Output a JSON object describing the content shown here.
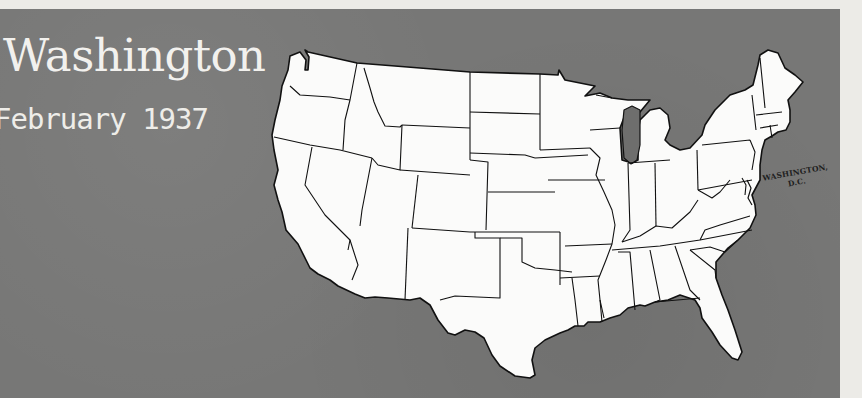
{
  "title": "Washington",
  "subtitle": "February 1937",
  "map": {
    "region": "Contiguous United States",
    "style": "white states with black borders on gray background",
    "label": {
      "line1": "WASHINGTON,",
      "line2": "D.C."
    }
  },
  "colors": {
    "background_panel": "#777776",
    "paper": "#ecebe7",
    "text": "#f2f1ee",
    "state_fill": "#fbfbfa",
    "state_border": "#111111",
    "lake": "#6e6e6d"
  }
}
